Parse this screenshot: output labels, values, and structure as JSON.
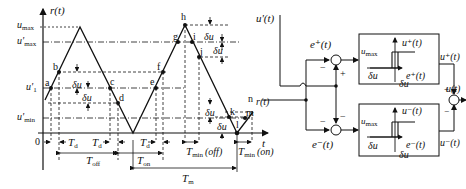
{
  "waveform": {
    "y_axis_label": "r(t)",
    "x_axis_label": "t",
    "origin_label": "0",
    "levels": {
      "u_max": "u",
      "u_max_sub": "max",
      "u_max_prime": "u'",
      "u_max_prime_sub": "max",
      "u1_prime": "u'",
      "u1_prime_sub": "1",
      "u_min_prime": "u'",
      "u_min_prime_sub": "min"
    },
    "points": [
      "a",
      "b",
      "c",
      "d",
      "e",
      "f",
      "g",
      "h",
      "i",
      "j",
      "k",
      "l",
      "m",
      "n"
    ],
    "delta_u": "δu",
    "intervals": {
      "Td": "T",
      "Td_sub": "d",
      "Toff": "T",
      "Toff_sub": "off",
      "Ton": "T",
      "Ton_sub": "on",
      "Tm": "T",
      "Tm_sub": "m",
      "Tmin_off": "T",
      "Tmin_off_sub": "min",
      "Tmin_off_suffix": "(off)",
      "Tmin_on": "T",
      "Tmin_on_sub": "min",
      "Tmin_on_suffix": "(on)"
    },
    "trace_label": "r(t)"
  },
  "block_diagram": {
    "input_label": "u'(t)",
    "r_label": "r(t)",
    "error_plus": "e⁺(t)",
    "error_minus": "e⁻(t)",
    "upper_block": {
      "out_axis": "u⁺(t)",
      "in_axis": "e⁺(t)",
      "umax": "u",
      "umax_sub": "max",
      "delta_left": "δu",
      "delta_right": "δu"
    },
    "lower_block": {
      "out_axis": "u⁻(t)",
      "in_axis": "e⁻(t)",
      "umax": "u",
      "umax_sub": "max",
      "delta_left": "δu",
      "delta_right": "δu"
    },
    "u_plus": "u⁺(t)",
    "u_minus": "u⁻(t)",
    "output": "u(t)",
    "signs": {
      "top_sum_left": "−",
      "top_sum_bottom": "+",
      "bot_sum_left": "−",
      "bot_sum_top": "−",
      "out_sum_top": "+",
      "out_sum_bottom": "−"
    }
  }
}
